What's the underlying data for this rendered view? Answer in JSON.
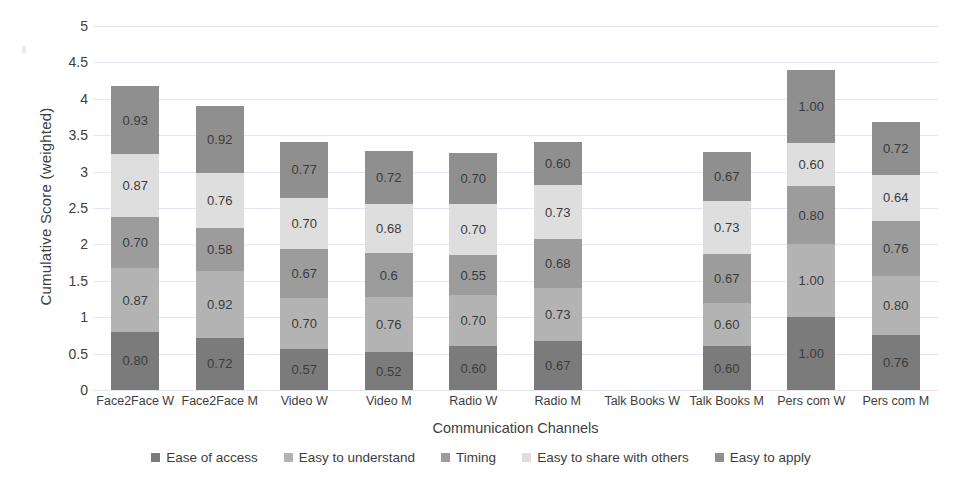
{
  "chart_data": {
    "type": "bar",
    "subtype": "stacked-bar",
    "title": "",
    "xlabel": "Communication Channels",
    "ylabel": "Cumulative  Score (weighted)",
    "ylim": [
      0,
      5
    ],
    "ytick_labels": [
      "0",
      "0.5",
      "1",
      "1.5",
      "2",
      "2.5",
      "3",
      "3.5",
      "4",
      "4.5",
      "5"
    ],
    "ytick_values": [
      0,
      0.5,
      1,
      1.5,
      2,
      2.5,
      3,
      3.5,
      4,
      4.5,
      5
    ],
    "grid": true,
    "legend_position": "bottom",
    "categories": [
      "Face2Face W",
      "Face2Face M",
      "Video W",
      "Video M",
      "Radio W",
      "Radio M",
      "Talk Books W",
      "Talk Books M",
      "Pers com W",
      "Pers com M"
    ],
    "series": [
      {
        "name": "Ease of access",
        "color": "#7b7b7b",
        "values": [
          0.8,
          0.72,
          0.57,
          0.52,
          0.6,
          0.67,
          null,
          0.6,
          1.0,
          0.76
        ],
        "labels": [
          "0.80",
          "0.72",
          "0.57",
          "0.52",
          "0.60",
          "0.67",
          "",
          "0.60",
          "1.00",
          "0.76"
        ]
      },
      {
        "name": "Easy to understand",
        "color": "#b3b3b3",
        "values": [
          0.87,
          0.92,
          0.7,
          0.76,
          0.7,
          0.73,
          null,
          0.6,
          1.0,
          0.8
        ],
        "labels": [
          "0.87",
          "0.92",
          "0.70",
          "0.76",
          "0.70",
          "0.73",
          "",
          "0.60",
          "1.00",
          "0.80"
        ]
      },
      {
        "name": "Timing",
        "color": "#9c9c9c",
        "values": [
          0.7,
          0.58,
          0.67,
          0.6,
          0.55,
          0.68,
          null,
          0.67,
          0.8,
          0.76
        ],
        "labels": [
          "0.70",
          "0.58",
          "0.67",
          "0.6",
          "0.55",
          "0.68",
          "",
          "0.67",
          "0.80",
          "0.76"
        ]
      },
      {
        "name": "Easy to share with others",
        "color": "#dedede",
        "values": [
          0.87,
          0.76,
          0.7,
          0.68,
          0.7,
          0.73,
          null,
          0.73,
          0.6,
          0.64
        ],
        "labels": [
          "0.87",
          "0.76",
          "0.70",
          "0.68",
          "0.70",
          "0.73",
          "",
          "0.73",
          "0.60",
          "0.64"
        ]
      },
      {
        "name": "Easy to apply",
        "color": "#8f8f8f",
        "values": [
          0.93,
          0.92,
          0.77,
          0.72,
          0.7,
          0.6,
          null,
          0.67,
          1.0,
          0.72
        ],
        "labels": [
          "0.93",
          "0.92",
          "0.77",
          "0.72",
          "0.70",
          "0.60",
          "",
          "0.67",
          "1.00",
          "0.72"
        ]
      }
    ],
    "totals": [
      4.17,
      3.9,
      3.41,
      3.28,
      3.25,
      3.41,
      0,
      3.27,
      4.4,
      3.68
    ]
  }
}
